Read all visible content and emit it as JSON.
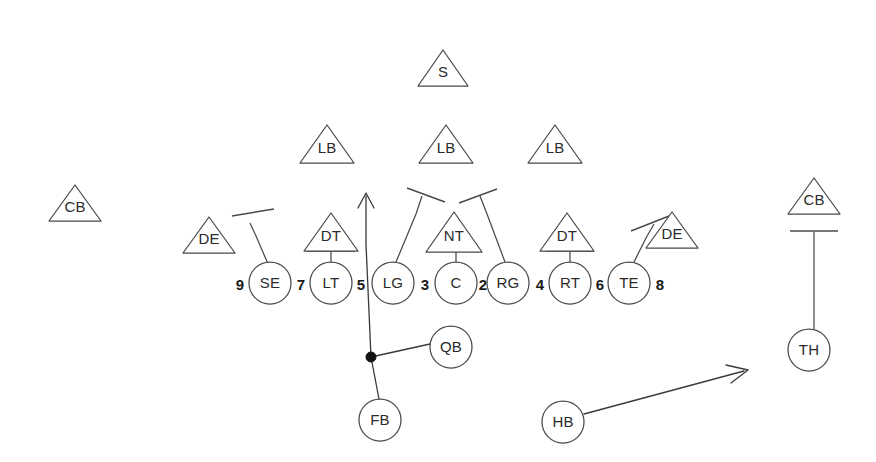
{
  "diagram": {
    "canvas": {
      "width": 876,
      "height": 462
    },
    "colors": {
      "background": "#ffffff",
      "stroke": "#4a4a4a",
      "route": "#3a3a3a",
      "text": "#2b2b2b",
      "hole_number": "#1a1a1a",
      "handoff_dot": "#111111"
    }
  },
  "defense": {
    "secondary": [
      {
        "label": "S",
        "x": 443,
        "y": 68,
        "w": 50,
        "h": 36,
        "name": "safety"
      },
      {
        "label": "CB",
        "x": 75,
        "y": 203,
        "w": 52,
        "h": 36,
        "name": "cornerback-left"
      },
      {
        "label": "CB",
        "x": 814,
        "y": 196,
        "w": 52,
        "h": 36,
        "name": "cornerback-right"
      }
    ],
    "linebackers": [
      {
        "label": "LB",
        "x": 327,
        "y": 144,
        "w": 54,
        "h": 38,
        "name": "linebacker-left"
      },
      {
        "label": "LB",
        "x": 446,
        "y": 144,
        "w": 54,
        "h": 38,
        "name": "linebacker-middle"
      },
      {
        "label": "LB",
        "x": 555,
        "y": 144,
        "w": 54,
        "h": 38,
        "name": "linebacker-right"
      }
    ],
    "line": [
      {
        "label": "DE",
        "x": 209,
        "y": 235,
        "w": 52,
        "h": 36,
        "name": "defensive-end-left"
      },
      {
        "label": "DT",
        "x": 331,
        "y": 232,
        "w": 54,
        "h": 38,
        "name": "defensive-tackle-left"
      },
      {
        "label": "NT",
        "x": 454,
        "y": 232,
        "w": 56,
        "h": 40,
        "name": "nose-tackle"
      },
      {
        "label": "DT",
        "x": 567,
        "y": 232,
        "w": 54,
        "h": 38,
        "name": "defensive-tackle-right"
      },
      {
        "label": "DE",
        "x": 672,
        "y": 230,
        "w": 52,
        "h": 36,
        "name": "defensive-end-right"
      }
    ]
  },
  "offense": {
    "line": [
      {
        "label": "SE",
        "x": 270,
        "y": 283,
        "r": 21,
        "name": "split-end"
      },
      {
        "label": "LT",
        "x": 331,
        "y": 283,
        "r": 21,
        "name": "left-tackle"
      },
      {
        "label": "LG",
        "x": 393,
        "y": 283,
        "r": 21,
        "name": "left-guard"
      },
      {
        "label": "C",
        "x": 456,
        "y": 283,
        "r": 21,
        "name": "center"
      },
      {
        "label": "RG",
        "x": 508,
        "y": 283,
        "r": 21,
        "name": "right-guard"
      },
      {
        "label": "RT",
        "x": 570,
        "y": 283,
        "r": 21,
        "name": "right-tackle"
      },
      {
        "label": "TE",
        "x": 629,
        "y": 283,
        "r": 21,
        "name": "tight-end"
      }
    ],
    "backfield": [
      {
        "label": "QB",
        "x": 451,
        "y": 347,
        "r": 21,
        "name": "quarterback"
      },
      {
        "label": "FB",
        "x": 380,
        "y": 420,
        "r": 21,
        "name": "fullback"
      },
      {
        "label": "HB",
        "x": 563,
        "y": 422,
        "r": 21,
        "name": "halfback"
      },
      {
        "label": "TH",
        "x": 809,
        "y": 350,
        "r": 21,
        "name": "throwback-receiver"
      }
    ]
  },
  "hole_numbers": [
    {
      "label": "9",
      "x": 240,
      "y": 285,
      "name": "hole-9"
    },
    {
      "label": "7",
      "x": 301,
      "y": 285,
      "name": "hole-7"
    },
    {
      "label": "5",
      "x": 361,
      "y": 285,
      "name": "hole-5"
    },
    {
      "label": "3",
      "x": 425,
      "y": 285,
      "name": "hole-3"
    },
    {
      "label": "2",
      "x": 483,
      "y": 285,
      "name": "hole-2"
    },
    {
      "label": "4",
      "x": 540,
      "y": 285,
      "name": "hole-4"
    },
    {
      "label": "6",
      "x": 600,
      "y": 285,
      "name": "hole-6"
    },
    {
      "label": "8",
      "x": 660,
      "y": 285,
      "name": "hole-8"
    }
  ],
  "blocks": [
    {
      "name": "block-se-to-left-end",
      "type": "angled",
      "path": "M 268 264 L 256 236 L 250 223",
      "cap": "M 232 216 L 274 209"
    },
    {
      "name": "block-lt-to-dt-left",
      "type": "drive",
      "path": "M 331 262 L 331 252",
      "cap": "M 307 251 L 355 251"
    },
    {
      "name": "block-lg-reach-left",
      "type": "angled",
      "path": "M 396 262 L 416 214 L 422 196",
      "cap": "M 407 188 L 445 202"
    },
    {
      "name": "block-c-to-nt",
      "type": "drive",
      "path": "M 456 262 L 456 252",
      "cap": "M 432 251 L 480 251"
    },
    {
      "name": "block-rg-reach-right",
      "type": "angled",
      "path": "M 505 262 L 487 214 L 480 196",
      "cap": "M 459 203 L 497 189"
    },
    {
      "name": "block-rt-to-dt-right",
      "type": "drive",
      "path": "M 570 262 L 570 252",
      "cap": "M 546 251 L 594 251"
    },
    {
      "name": "block-te-to-right-end",
      "type": "angled",
      "path": "M 633 264 L 646 238 L 654 224",
      "cap": "M 631 231 L 669 216"
    },
    {
      "name": "block-cb-to-th",
      "type": "drive",
      "path": "M 814 232 L 814 330",
      "cap": "M 790 231 L 838 231"
    }
  ],
  "routes": [
    {
      "name": "ball-carrier-path",
      "description": "Ball carrier runs through the 5 hole",
      "path": "M 371 357 L 366 244 L 366 196",
      "arrow": "M 358 208 L 366 193 L 374 208"
    },
    {
      "name": "handoff-to-quarterback",
      "description": "Exchange line from mesh point to quarterback",
      "path": "M 371 357 L 430 344",
      "arrow": ""
    },
    {
      "name": "fullback-path",
      "description": "Fullback to mesh point",
      "path": "M 371 357 L 379 399",
      "arrow": ""
    },
    {
      "name": "halfback-path",
      "description": "Halfback flares out to the right",
      "path": "M 584 414 L 744 371",
      "arrow": "M 726 365 L 748 370 L 731 383"
    }
  ],
  "handoff_point": {
    "name": "mesh-point",
    "x": 371,
    "y": 357,
    "r": 5
  }
}
